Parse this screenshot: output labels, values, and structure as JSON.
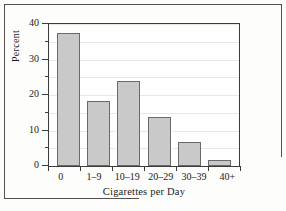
{
  "chart_data": {
    "type": "bar",
    "title": "",
    "xlabel": "Cigarettes per Day",
    "ylabel": "Percent",
    "categories": [
      "0",
      "1–9",
      "10–19",
      "20–29",
      "30–39",
      "40+"
    ],
    "values": [
      37.6,
      18.3,
      23.9,
      13.8,
      6.8,
      1.7
    ],
    "ylim": [
      0,
      40
    ],
    "y_major_ticks": [
      0,
      10,
      20,
      30,
      40
    ],
    "y_minor_ticks": [
      5,
      15,
      25,
      35
    ],
    "y_tick_labels": [
      "0",
      "10",
      "20",
      "30",
      "40"
    ],
    "grid": true,
    "legend": "none",
    "bar_fill_color": "#c9c9c9",
    "bar_border_color": "#6a6a6a",
    "axis_color": "#3b3b3b",
    "grid_color": "#ece9e4"
  }
}
